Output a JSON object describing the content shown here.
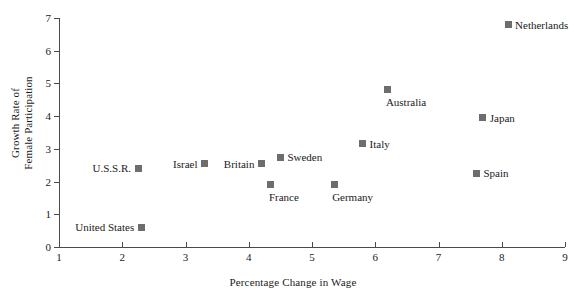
{
  "chart_data": {
    "type": "scatter",
    "title": "",
    "xlabel": "Percentage Change in Wage",
    "ylabel_line1": "Growth Rate of",
    "ylabel_line2": "Female Participation",
    "xlim": [
      1,
      9
    ],
    "ylim": [
      0,
      7
    ],
    "xticks": [
      "1",
      "2",
      "3",
      "4",
      "5",
      "6",
      "7",
      "8",
      "9"
    ],
    "yticks": [
      "0",
      "1",
      "2",
      "3",
      "4",
      "5",
      "6",
      "7"
    ],
    "grid": false,
    "legend": "none",
    "marker_color": "#6d6d6d",
    "axis_color": "#4a4a4a",
    "points": [
      {
        "label": "United States",
        "x": 2.3,
        "y": 0.6,
        "label_pos": "left"
      },
      {
        "label": "U.S.S.R.",
        "x": 2.25,
        "y": 2.4,
        "label_pos": "left"
      },
      {
        "label": "Israel",
        "x": 3.3,
        "y": 2.55,
        "label_pos": "left"
      },
      {
        "label": "Britain",
        "x": 4.2,
        "y": 2.55,
        "label_pos": "left"
      },
      {
        "label": "France",
        "x": 4.35,
        "y": 1.9,
        "label_pos": "below"
      },
      {
        "label": "Sweden",
        "x": 4.5,
        "y": 2.75,
        "label_pos": "right"
      },
      {
        "label": "Germany",
        "x": 5.35,
        "y": 1.9,
        "label_pos": "below"
      },
      {
        "label": "Italy",
        "x": 5.8,
        "y": 3.15,
        "label_pos": "right"
      },
      {
        "label": "Australia",
        "x": 6.2,
        "y": 4.8,
        "label_pos": "below"
      },
      {
        "label": "Spain",
        "x": 7.6,
        "y": 2.25,
        "label_pos": "right"
      },
      {
        "label": "Japan",
        "x": 7.7,
        "y": 3.95,
        "label_pos": "right"
      },
      {
        "label": "Netherlands",
        "x": 8.1,
        "y": 6.8,
        "label_pos": "right"
      }
    ]
  }
}
